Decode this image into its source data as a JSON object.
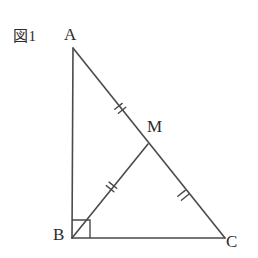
{
  "figure": {
    "caption": "図1",
    "type": "geometry-diagram",
    "background_color": "#ffffff",
    "stroke_color": "#4a4a4a",
    "label_color": "#2b2b2b",
    "vertices": [
      {
        "name": "A",
        "label": "A",
        "x": 73,
        "y": 48,
        "label_x": 64,
        "label_y": 25
      },
      {
        "name": "B",
        "label": "B",
        "x": 72,
        "y": 238,
        "label_x": 53,
        "label_y": 225
      },
      {
        "name": "C",
        "label": "C",
        "x": 225,
        "y": 238,
        "label_x": 226,
        "label_y": 232
      },
      {
        "name": "M",
        "label": "M",
        "x": 148,
        "y": 144,
        "label_x": 147,
        "label_y": 117
      }
    ],
    "segments": [
      {
        "name": "AB",
        "from": "A",
        "to": "B"
      },
      {
        "name": "BC",
        "from": "B",
        "to": "C"
      },
      {
        "name": "AC",
        "from": "A",
        "to": "C"
      },
      {
        "name": "BM",
        "from": "B",
        "to": "M"
      }
    ],
    "tick_marks": [
      {
        "name": "AM",
        "segment": "A-M",
        "count": 2,
        "x": 120,
        "y": 105
      },
      {
        "name": "BM",
        "segment": "B-M",
        "count": 2,
        "x": 111,
        "y": 190
      },
      {
        "name": "MC",
        "segment": "M-C",
        "count": 2,
        "x": 183,
        "y": 192
      }
    ],
    "right_angle": {
      "name": "angle-ABC",
      "vertex": "B",
      "size": 18
    }
  }
}
